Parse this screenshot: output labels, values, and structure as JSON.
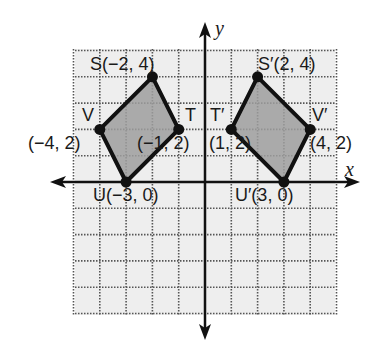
{
  "figure": {
    "axes": {
      "x_label": "x",
      "y_label": "y"
    },
    "grid": {
      "x_min": -5,
      "x_max": 5,
      "y_min": -5,
      "y_max": 5,
      "style": "dotted"
    },
    "colors": {
      "fill": "#9e9e9e",
      "stroke": "#111111",
      "grid_bg": "#eeeeee",
      "grid_line": "#555555"
    },
    "original": {
      "name": "STUV",
      "points": [
        {
          "name": "S",
          "x": -2,
          "y": 4,
          "label": "S(−2, 4)"
        },
        {
          "name": "T",
          "x": -1,
          "y": 2,
          "label_name": "T",
          "label_coords": "(−1, 2)"
        },
        {
          "name": "U",
          "x": -3,
          "y": 0,
          "label": "U(−3, 0)"
        },
        {
          "name": "V",
          "x": -4,
          "y": 2,
          "label_name": "V",
          "label_coords": "(−4, 2)"
        }
      ]
    },
    "image": {
      "name": "S'T'U'V'",
      "points": [
        {
          "name": "S'",
          "x": 2,
          "y": 4,
          "label": "S′(2, 4)"
        },
        {
          "name": "T'",
          "x": 1,
          "y": 2,
          "label_name": "T′",
          "label_coords": "(1, 2)"
        },
        {
          "name": "U'",
          "x": 3,
          "y": 0,
          "label": "U′(3, 0)"
        },
        {
          "name": "V'",
          "x": 4,
          "y": 2,
          "label_name": "V′",
          "label_coords": "(4, 2)"
        }
      ]
    }
  }
}
